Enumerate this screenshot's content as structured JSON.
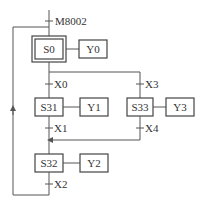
{
  "diagram": {
    "type": "SFC (sequential function chart)",
    "initial_condition": "M8002",
    "steps": {
      "s0": {
        "label": "S0",
        "initial": true,
        "output": "Y0"
      },
      "s31": {
        "label": "S31",
        "output": "Y1"
      },
      "s33": {
        "label": "S33",
        "output": "Y3"
      },
      "s32": {
        "label": "S32",
        "output": "Y2"
      }
    },
    "transitions": {
      "x0": "X0",
      "x3": "X3",
      "x1": "X1",
      "x4": "X4",
      "x2": "X2"
    },
    "colors": {
      "line": "#555555",
      "box": "#444444",
      "text": "#333333"
    }
  }
}
